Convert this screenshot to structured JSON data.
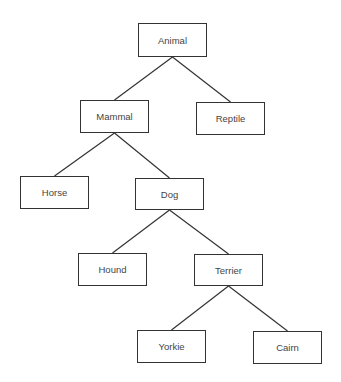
{
  "diagram": {
    "type": "tree",
    "colors": {
      "line": "#333333",
      "text": "#444444",
      "background": "#ffffff"
    },
    "nodes": [
      {
        "id": "animal",
        "label": "Animal",
        "x": 138,
        "y": 23,
        "w": 69,
        "h": 34
      },
      {
        "id": "mammal",
        "label": "Mammal",
        "x": 80,
        "y": 100,
        "w": 69,
        "h": 33
      },
      {
        "id": "reptile",
        "label": "Reptile",
        "x": 196,
        "y": 102,
        "w": 69,
        "h": 33
      },
      {
        "id": "horse",
        "label": "Horse",
        "x": 20,
        "y": 176,
        "w": 69,
        "h": 33
      },
      {
        "id": "dog",
        "label": "Dog",
        "x": 135,
        "y": 178,
        "w": 69,
        "h": 32
      },
      {
        "id": "hound",
        "label": "Hound",
        "x": 78,
        "y": 253,
        "w": 69,
        "h": 33
      },
      {
        "id": "terrier",
        "label": "Terrier",
        "x": 194,
        "y": 254,
        "w": 69,
        "h": 32
      },
      {
        "id": "yorkie",
        "label": "Yorkie",
        "x": 137,
        "y": 330,
        "w": 69,
        "h": 33
      },
      {
        "id": "cairn",
        "label": "Cairn",
        "x": 253,
        "y": 331,
        "w": 69,
        "h": 33
      }
    ],
    "edges": [
      [
        "animal",
        "mammal"
      ],
      [
        "animal",
        "reptile"
      ],
      [
        "mammal",
        "horse"
      ],
      [
        "mammal",
        "dog"
      ],
      [
        "dog",
        "hound"
      ],
      [
        "dog",
        "terrier"
      ],
      [
        "terrier",
        "yorkie"
      ],
      [
        "terrier",
        "cairn"
      ]
    ]
  }
}
